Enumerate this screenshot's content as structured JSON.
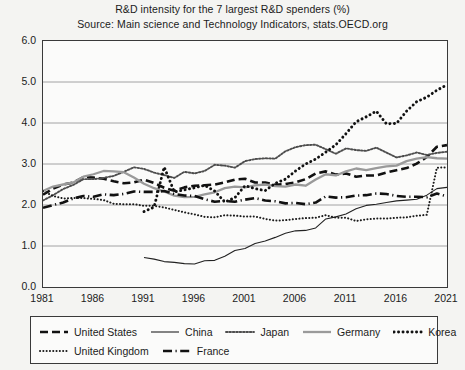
{
  "title": {
    "line1": "R&D intensity for the 7 largest R&D spenders (%)",
    "line2": "Source: Main science and Technology Indicators, stats.OECD.org"
  },
  "chart_data": {
    "type": "line",
    "title": "R&D intensity for the 7 largest R&D spenders (%)",
    "subtitle": "Source: Main science and Technology Indicators, stats.OECD.org",
    "xlabel": "",
    "ylabel": "",
    "xlim": [
      1981,
      2021
    ],
    "ylim": [
      0.0,
      6.0
    ],
    "grid": true,
    "legend_position": "bottom",
    "xticks": [
      1981,
      1986,
      1991,
      1996,
      2001,
      2006,
      2011,
      2016,
      2021
    ],
    "yticks": [
      "0.0",
      "1.0",
      "2.0",
      "3.0",
      "4.0",
      "5.0",
      "6.0"
    ],
    "x": [
      1981,
      1982,
      1983,
      1984,
      1985,
      1986,
      1987,
      1988,
      1989,
      1990,
      1991,
      1992,
      1993,
      1994,
      1995,
      1996,
      1997,
      1998,
      1999,
      2000,
      2001,
      2002,
      2003,
      2004,
      2005,
      2006,
      2007,
      2008,
      2009,
      2010,
      2011,
      2012,
      2013,
      2014,
      2015,
      2016,
      2017,
      2018,
      2019,
      2020,
      2021
    ],
    "series": [
      {
        "name": "United States",
        "style": "thick-dashed",
        "color": "#111111",
        "values": [
          2.25,
          2.4,
          2.5,
          2.55,
          2.68,
          2.67,
          2.64,
          2.58,
          2.53,
          2.55,
          2.62,
          2.54,
          2.42,
          2.35,
          2.43,
          2.47,
          2.48,
          2.5,
          2.55,
          2.62,
          2.64,
          2.55,
          2.55,
          2.49,
          2.51,
          2.55,
          2.63,
          2.77,
          2.82,
          2.74,
          2.77,
          2.69,
          2.72,
          2.72,
          2.79,
          2.85,
          2.9,
          3.01,
          3.17,
          3.42,
          3.46
        ]
      },
      {
        "name": "China",
        "style": "thin-solid",
        "color": "#222222",
        "values": [
          null,
          null,
          null,
          null,
          null,
          null,
          null,
          null,
          null,
          null,
          0.72,
          0.68,
          0.62,
          0.6,
          0.57,
          0.56,
          0.64,
          0.65,
          0.75,
          0.89,
          0.94,
          1.06,
          1.12,
          1.21,
          1.31,
          1.37,
          1.38,
          1.44,
          1.66,
          1.71,
          1.78,
          1.91,
          1.99,
          2.02,
          2.06,
          2.1,
          2.12,
          2.14,
          2.24,
          2.4,
          2.43
        ]
      },
      {
        "name": "Japan",
        "style": "fine-dotted-gray",
        "color": "#4d4d4d",
        "values": [
          2.11,
          2.24,
          2.39,
          2.49,
          2.63,
          2.63,
          2.66,
          2.71,
          2.81,
          2.92,
          2.88,
          2.79,
          2.73,
          2.66,
          2.81,
          2.77,
          2.83,
          2.98,
          2.96,
          2.91,
          3.07,
          3.12,
          3.14,
          3.13,
          3.31,
          3.41,
          3.46,
          3.47,
          3.36,
          3.25,
          3.38,
          3.34,
          3.32,
          3.4,
          3.28,
          3.16,
          3.21,
          3.28,
          3.22,
          3.27,
          3.3
        ]
      },
      {
        "name": "Germany",
        "style": "thick-solid-gray",
        "color": "#9a9a9a",
        "values": [
          2.34,
          2.45,
          2.5,
          2.55,
          2.69,
          2.75,
          2.83,
          2.82,
          2.8,
          2.67,
          2.52,
          2.41,
          2.33,
          2.23,
          2.19,
          2.2,
          2.26,
          2.31,
          2.41,
          2.45,
          2.43,
          2.48,
          2.5,
          2.46,
          2.45,
          2.5,
          2.47,
          2.62,
          2.75,
          2.72,
          2.82,
          2.89,
          2.85,
          2.9,
          2.94,
          2.96,
          3.07,
          3.13,
          3.17,
          3.14,
          3.13
        ]
      },
      {
        "name": "Korea",
        "style": "bold-dotted",
        "color": "#111111",
        "values": [
          null,
          null,
          null,
          null,
          null,
          null,
          null,
          null,
          null,
          null,
          1.84,
          1.95,
          2.925,
          2.32,
          2.37,
          2.42,
          2.48,
          2.34,
          2.07,
          2.18,
          2.47,
          2.4,
          2.35,
          2.53,
          2.63,
          2.83,
          3.0,
          3.12,
          3.29,
          3.47,
          3.74,
          4.03,
          4.15,
          4.29,
          3.98,
          3.99,
          4.29,
          4.52,
          4.63,
          4.8,
          4.93
        ]
      },
      {
        "name": "United Kingdom",
        "style": "dotted",
        "color": "#1b1b1b",
        "values": [
          2.34,
          2.22,
          2.16,
          2.17,
          2.17,
          2.15,
          2.12,
          2.03,
          2.02,
          2.02,
          1.98,
          1.98,
          1.94,
          1.88,
          1.82,
          1.77,
          1.71,
          1.7,
          1.75,
          1.74,
          1.72,
          1.72,
          1.66,
          1.62,
          1.63,
          1.66,
          1.68,
          1.69,
          1.75,
          1.69,
          1.69,
          1.61,
          1.65,
          1.67,
          1.67,
          1.69,
          1.7,
          1.74,
          1.76,
          2.91,
          2.92
        ]
      },
      {
        "name": "France",
        "style": "dash-dot",
        "color": "#111111",
        "values": [
          1.93,
          2.0,
          2.06,
          2.16,
          2.22,
          2.2,
          2.26,
          2.24,
          2.27,
          2.33,
          2.32,
          2.32,
          2.34,
          2.27,
          2.23,
          2.22,
          2.14,
          2.08,
          2.1,
          2.08,
          2.13,
          2.17,
          2.11,
          2.09,
          2.04,
          2.05,
          2.02,
          2.06,
          2.21,
          2.18,
          2.19,
          2.23,
          2.24,
          2.28,
          2.27,
          2.22,
          2.2,
          2.2,
          2.19,
          2.28,
          2.21
        ]
      }
    ]
  },
  "legend": {
    "rows": [
      [
        {
          "label": "United States",
          "style": "thick-dashed"
        },
        {
          "label": "China",
          "style": "thin-solid"
        },
        {
          "label": "Japan",
          "style": "fine-dotted-gray"
        },
        {
          "label": "Germany",
          "style": "thick-solid-gray"
        },
        {
          "label": "Korea",
          "style": "bold-dotted"
        }
      ],
      [
        {
          "label": "United Kingdom",
          "style": "dotted"
        },
        {
          "label": "France",
          "style": "dash-dot"
        }
      ]
    ]
  }
}
